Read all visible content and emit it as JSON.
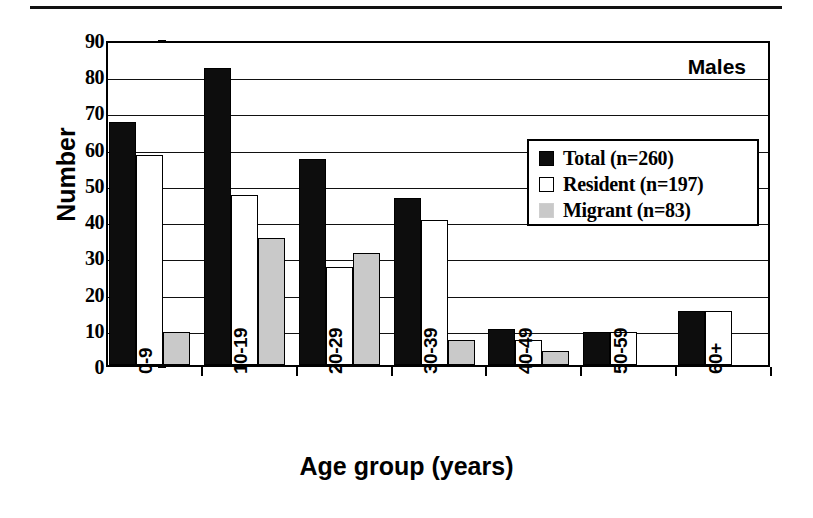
{
  "figure": {
    "panel_label": "Males",
    "y_axis_title": "Number",
    "x_axis_title": "Age group (years)"
  },
  "legend": {
    "items": [
      {
        "label": "Total (n=260)",
        "swatch": "filled-black-square-icon",
        "color": "#0d0d0d"
      },
      {
        "label": "Resident (n=197)",
        "swatch": "open-white-square-icon",
        "color": "#ffffff"
      },
      {
        "label": "Migrant (n=83)",
        "swatch": "filled-gray-square-icon",
        "color": "#c9c9c9"
      }
    ]
  },
  "chart_data": {
    "type": "bar",
    "title": "Males",
    "xlabel": "Age group (years)",
    "ylabel": "Number",
    "ylim": [
      0,
      90
    ],
    "yticks": [
      0,
      10,
      20,
      30,
      40,
      50,
      60,
      70,
      80,
      90
    ],
    "ytick_labels": [
      "0",
      "10",
      "20",
      "30",
      "40",
      "50",
      "60",
      "70",
      "80",
      "90"
    ],
    "grid": true,
    "legend_position": "upper right",
    "categories": [
      "0-9",
      "10-19",
      "20-29",
      "30-39",
      "40-49",
      "50-59",
      "60+"
    ],
    "series": [
      {
        "name": "Total (n=260)",
        "color": "#0d0d0d",
        "values": [
          67,
          82,
          57,
          46,
          10,
          9,
          15
        ]
      },
      {
        "name": "Resident (n=197)",
        "color": "#ffffff",
        "values": [
          58,
          47,
          27,
          40,
          7,
          9,
          15
        ]
      },
      {
        "name": "Migrant (n=83)",
        "color": "#c9c9c9",
        "values": [
          9,
          35,
          31,
          7,
          4,
          0,
          0
        ]
      }
    ]
  }
}
